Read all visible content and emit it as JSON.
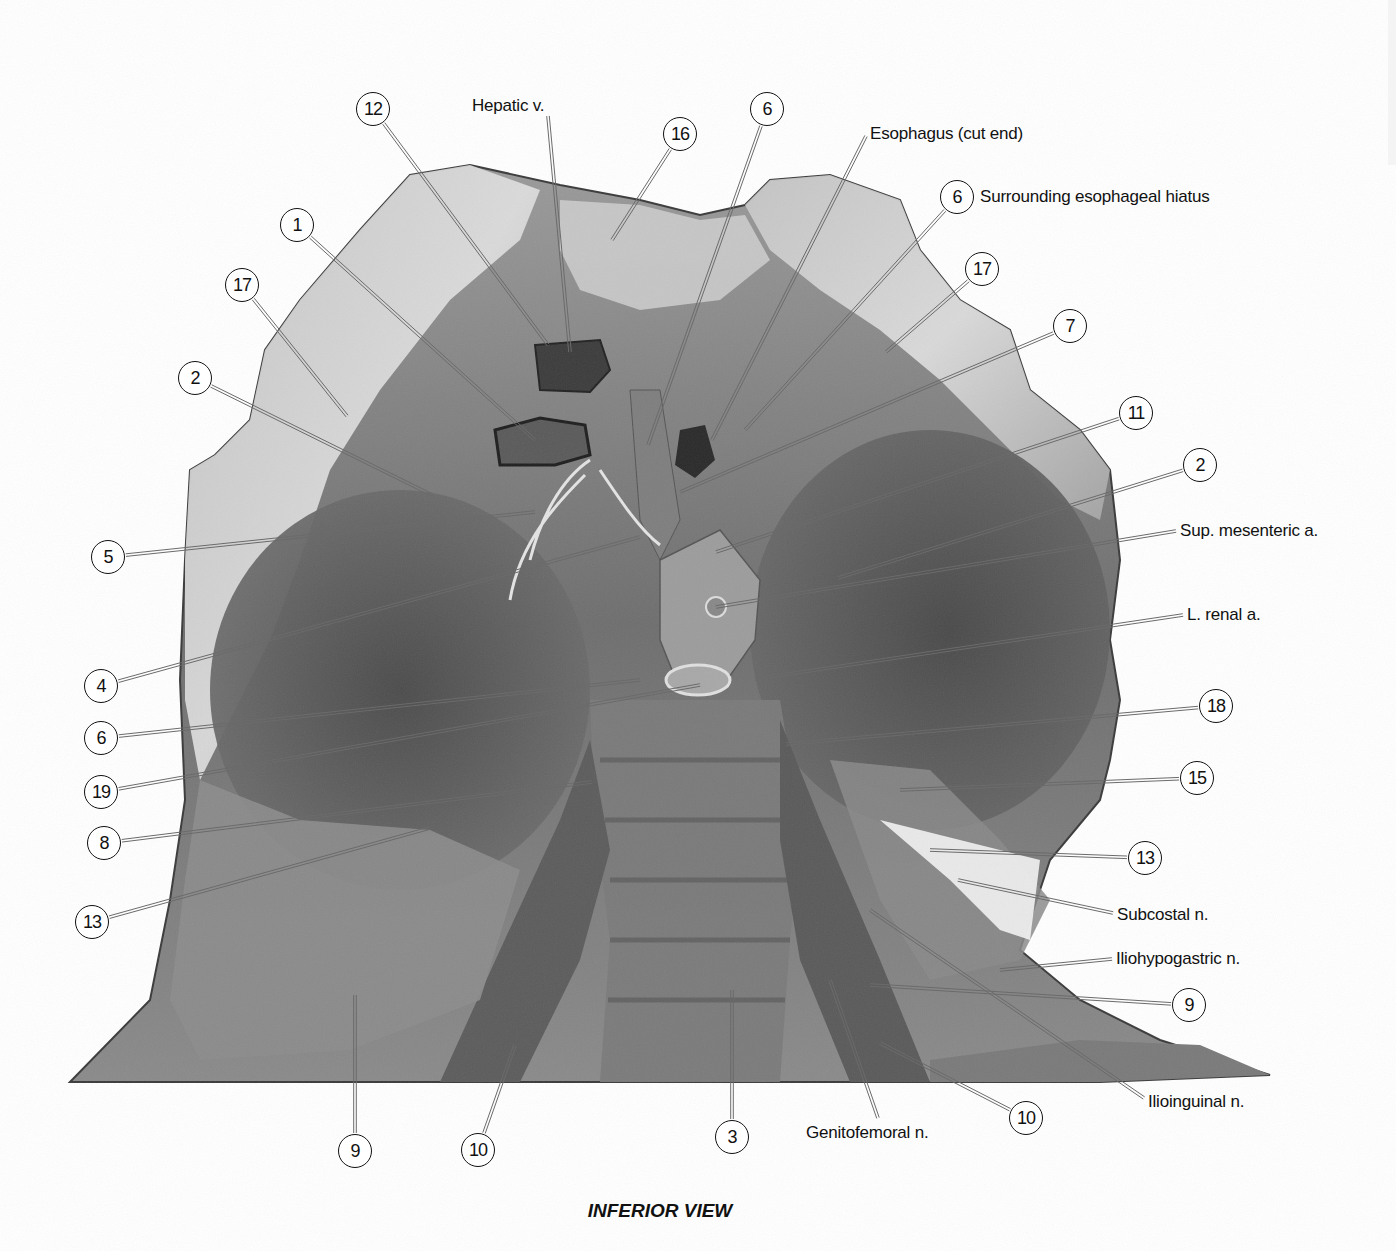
{
  "figure": {
    "caption": "INFERIOR VIEW",
    "colors": {
      "leader_line": "#6b6b6b",
      "label_text": "#111111",
      "background": "#ffffff"
    }
  },
  "callouts": [
    {
      "id": "c12a",
      "number": "12",
      "x": 373,
      "y": 109,
      "tx": 548,
      "ty": 345
    },
    {
      "id": "c16",
      "number": "16",
      "x": 680,
      "y": 134,
      "tx": 612,
      "ty": 240
    },
    {
      "id": "c6a",
      "number": "6",
      "x": 767,
      "y": 109,
      "tx": 648,
      "ty": 445
    },
    {
      "id": "c6b",
      "number": "6",
      "x": 957,
      "y": 197,
      "tx": 745,
      "ty": 430
    },
    {
      "id": "c1",
      "number": "1",
      "x": 297,
      "y": 225,
      "tx": 535,
      "ty": 440
    },
    {
      "id": "c17a",
      "number": "17",
      "x": 242,
      "y": 285,
      "tx": 347,
      "ty": 416
    },
    {
      "id": "c17b",
      "number": "17",
      "x": 982,
      "y": 269,
      "tx": 886,
      "ty": 352
    },
    {
      "id": "c7",
      "number": "7",
      "x": 1070,
      "y": 326,
      "tx": 680,
      "ty": 492
    },
    {
      "id": "c2a",
      "number": "2",
      "x": 195,
      "y": 378,
      "tx": 432,
      "ty": 495
    },
    {
      "id": "c11",
      "number": "11",
      "x": 1136,
      "y": 413,
      "tx": 716,
      "ty": 552
    },
    {
      "id": "c2b",
      "number": "2",
      "x": 1200,
      "y": 465,
      "tx": 838,
      "ty": 578
    },
    {
      "id": "c5",
      "number": "5",
      "x": 108,
      "y": 557,
      "tx": 535,
      "ty": 512
    },
    {
      "id": "c4",
      "number": "4",
      "x": 101,
      "y": 686,
      "tx": 640,
      "ty": 537
    },
    {
      "id": "c18",
      "number": "18",
      "x": 1216,
      "y": 706,
      "tx": 786,
      "ty": 744
    },
    {
      "id": "c6c",
      "number": "6",
      "x": 101,
      "y": 738,
      "tx": 640,
      "ty": 680
    },
    {
      "id": "c15",
      "number": "15",
      "x": 1197,
      "y": 778,
      "tx": 900,
      "ty": 790
    },
    {
      "id": "c19",
      "number": "19",
      "x": 101,
      "y": 792,
      "tx": 700,
      "ty": 685
    },
    {
      "id": "c8",
      "number": "8",
      "x": 104,
      "y": 843,
      "tx": 592,
      "ty": 782
    },
    {
      "id": "c13a",
      "number": "13",
      "x": 1145,
      "y": 858,
      "tx": 930,
      "ty": 850
    },
    {
      "id": "c13b",
      "number": "13",
      "x": 92,
      "y": 922,
      "tx": 430,
      "ty": 828
    },
    {
      "id": "c9a",
      "number": "9",
      "x": 1189,
      "y": 1005,
      "tx": 870,
      "ty": 985
    },
    {
      "id": "c9b",
      "number": "9",
      "x": 355,
      "y": 1151,
      "tx": 355,
      "ty": 995
    },
    {
      "id": "c10a",
      "number": "10",
      "x": 478,
      "y": 1150,
      "tx": 515,
      "ty": 1045
    },
    {
      "id": "c3",
      "number": "3",
      "x": 732,
      "y": 1137,
      "tx": 732,
      "ty": 990
    },
    {
      "id": "c10b",
      "number": "10",
      "x": 1026,
      "y": 1118,
      "tx": 880,
      "ty": 1043
    }
  ],
  "text_labels": [
    {
      "id": "hepatic-v",
      "text": "Hepatic v.",
      "x": 472,
      "y": 106,
      "tx": 570,
      "ty": 352,
      "ax": 548,
      "ay": 116
    },
    {
      "id": "esophagus",
      "text": "Esophagus (cut end)",
      "x": 870,
      "y": 134,
      "tx": 712,
      "ty": 440,
      "ax": 866,
      "ay": 136
    },
    {
      "id": "hiatus",
      "text": "Surrounding esophageal hiatus",
      "x": 980,
      "y": 197,
      "tx": null,
      "ty": null,
      "ax": null,
      "ay": null
    },
    {
      "id": "sup-mes-a",
      "text": "Sup. mesenteric a.",
      "x": 1180,
      "y": 531,
      "tx": 716,
      "ty": 607,
      "ax": 1176,
      "ay": 531
    },
    {
      "id": "l-renal-a",
      "text": "L. renal a.",
      "x": 1187,
      "y": 615,
      "tx": 755,
      "ty": 679,
      "ax": 1183,
      "ay": 615
    },
    {
      "id": "subcostal-n",
      "text": "Subcostal n.",
      "x": 1117,
      "y": 915,
      "tx": 958,
      "ty": 880,
      "ax": 1113,
      "ay": 913
    },
    {
      "id": "iliohypo-n",
      "text": "Iliohypogastric n.",
      "x": 1116,
      "y": 959,
      "tx": 1000,
      "ty": 970,
      "ax": 1112,
      "ay": 959
    },
    {
      "id": "ilioinguinal",
      "text": "Ilioinguinal n.",
      "x": 1148,
      "y": 1102,
      "tx": 870,
      "ty": 910,
      "ax": 1144,
      "ay": 1098
    },
    {
      "id": "genitofem-n",
      "text": "Genitofemoral n.",
      "x": 806,
      "y": 1133,
      "tx": 830,
      "ty": 980,
      "ax": 878,
      "ay": 1118
    }
  ]
}
